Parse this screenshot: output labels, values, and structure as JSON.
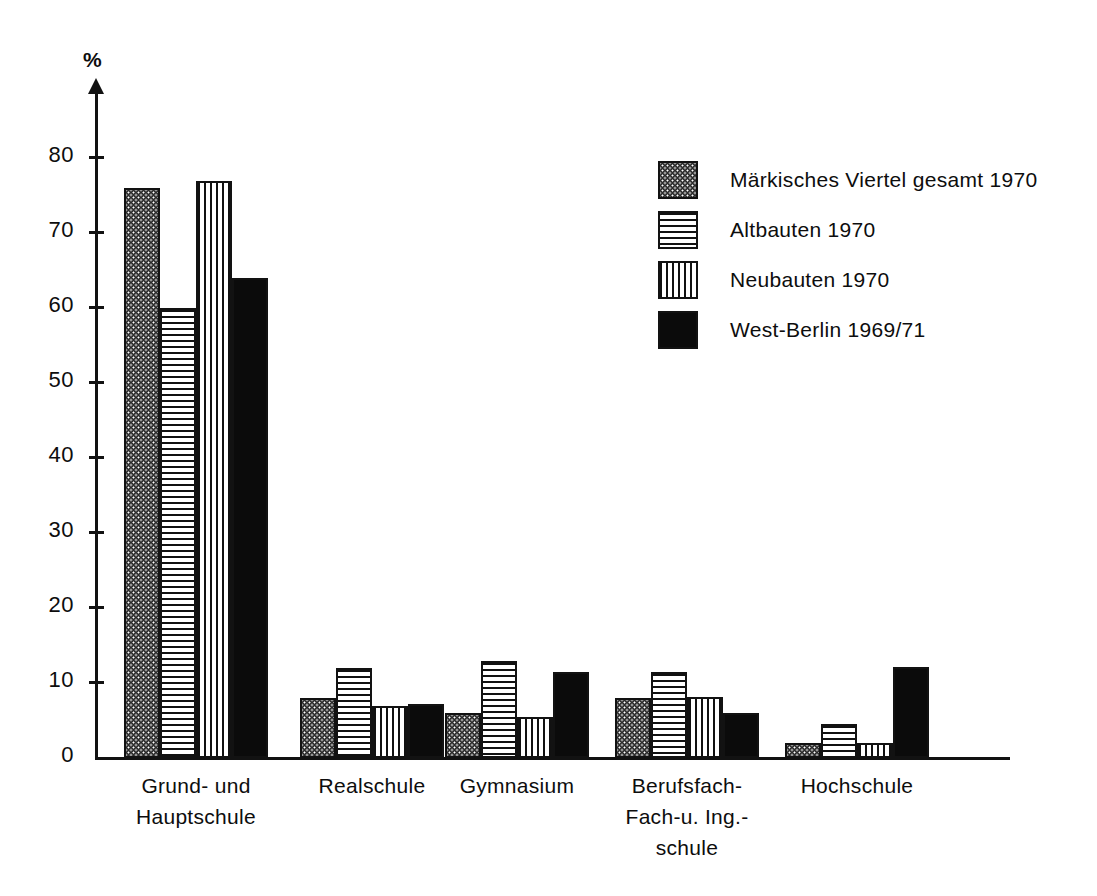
{
  "chart_data": {
    "type": "bar",
    "title": "",
    "xlabel": "",
    "ylabel": "%",
    "ylim": [
      0,
      85
    ],
    "yticks": [
      0,
      10,
      20,
      30,
      40,
      50,
      60,
      70,
      80
    ],
    "grid": false,
    "legend_position": "upper right",
    "categories": [
      "Grund- und\nHauptschule",
      "Realschule",
      "Gymnasium",
      "Berufsfach-\nFach-u. Ing.-\nschule",
      "Hochschule"
    ],
    "series": [
      {
        "name": "Märkisches Viertel gesamt 1970",
        "pattern": "checkerboard",
        "values": [
          76,
          8,
          6,
          8,
          2
        ]
      },
      {
        "name": "Altbauten 1970",
        "pattern": "horizontal-lines",
        "values": [
          60,
          12,
          13,
          11.5,
          4.5
        ]
      },
      {
        "name": "Neubauten 1970",
        "pattern": "vertical-lines",
        "values": [
          77,
          7,
          5.5,
          8.2,
          2
        ]
      },
      {
        "name": "West-Berlin 1969/71",
        "pattern": "solid-black",
        "values": [
          64,
          7.2,
          11.5,
          6,
          12.2
        ]
      }
    ]
  },
  "axis": {
    "unit_label": "%",
    "tick_labels": [
      "0",
      "10",
      "20",
      "30",
      "40",
      "50",
      "60",
      "70",
      "80"
    ]
  },
  "legend": {
    "items": [
      {
        "label": "Märkisches Viertel gesamt 1970"
      },
      {
        "label": "Altbauten 1970"
      },
      {
        "label": "Neubauten 1970"
      },
      {
        "label": "West-Berlin 1969/71"
      }
    ]
  },
  "colors": {
    "ink": "#121212",
    "paper": "#ffffff",
    "series_solid": "#0b0b0b",
    "series_checker": "#2b2b2b"
  }
}
